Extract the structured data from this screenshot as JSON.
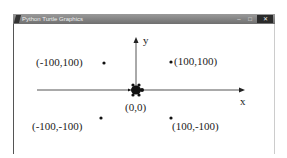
{
  "window": {
    "title": "Python Turtle Graphics",
    "controls": {
      "minimize": "–",
      "maximize": "□",
      "close": "✕"
    }
  },
  "canvas": {
    "axes": {
      "x_label": "x",
      "y_label": "y"
    },
    "origin_label": "(0,0)",
    "points": [
      {
        "label": "(-100,100)",
        "x": -100,
        "y": 100
      },
      {
        "label": "(100,100)",
        "x": 100,
        "y": 100
      },
      {
        "label": "(-100,-100)",
        "x": -100,
        "y": -100
      },
      {
        "label": "(100,-100)",
        "x": 100,
        "y": -100
      }
    ],
    "turtle": {
      "shape": "turtle-icon",
      "position": "(0,0)",
      "color": "#000000"
    }
  }
}
